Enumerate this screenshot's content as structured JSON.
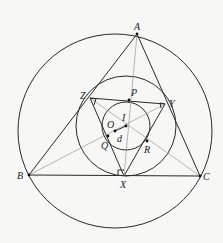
{
  "diagram": {
    "points": {
      "A": {
        "label": "A",
        "x": 137,
        "y": 34
      },
      "B": {
        "label": "B",
        "x": 29,
        "y": 175
      },
      "C": {
        "label": "C",
        "x": 200,
        "y": 176
      },
      "X": {
        "label": "X",
        "x": 124,
        "y": 176
      },
      "Y": {
        "label": "Y",
        "x": 165,
        "y": 104
      },
      "Z": {
        "label": "Z",
        "x": 90,
        "y": 98
      },
      "P": {
        "label": "P",
        "x": 129,
        "y": 100
      },
      "Q": {
        "label": "Q",
        "x": 108,
        "y": 136
      },
      "R": {
        "label": "R",
        "x": 147,
        "y": 141
      },
      "I": {
        "label": "I",
        "x": 126,
        "y": 126
      },
      "O": {
        "label": "O",
        "x": 115,
        "y": 131
      }
    },
    "segment_label": "d",
    "colors": {
      "stroke": "#2a2a2a",
      "construction": "#8a8a8a",
      "background": "#f7f7f5"
    }
  }
}
